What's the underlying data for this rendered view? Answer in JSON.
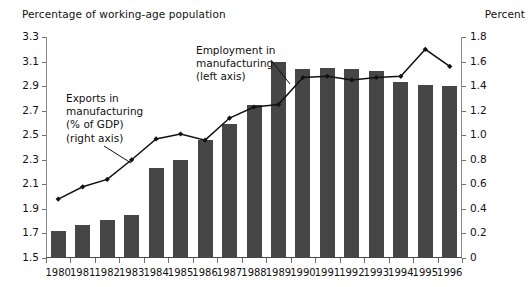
{
  "chart_data": {
    "type": "bar",
    "title": "",
    "categories": [
      "1980",
      "1981",
      "1982",
      "1983",
      "1984",
      "1985",
      "1986",
      "1987",
      "1988",
      "1989",
      "1990",
      "1991",
      "1992",
      "1993",
      "1994",
      "1995",
      "1996"
    ],
    "xlabel": "",
    "grid": false,
    "legend_position": "inline-annotations",
    "series": [
      {
        "name": "Employment in manufacturing (left axis)",
        "type": "bar",
        "axis": "left",
        "color": "#464646",
        "values": [
          1.72,
          1.77,
          1.81,
          1.85,
          2.23,
          2.3,
          2.46,
          2.59,
          2.75,
          3.1,
          3.04,
          3.05,
          3.04,
          3.02,
          2.93,
          2.91,
          2.9
        ]
      },
      {
        "name": "Exports in manufacturing (% of GDP) (right axis)",
        "type": "line",
        "axis": "right",
        "color": "#111111",
        "values": [
          0.48,
          0.58,
          0.64,
          0.8,
          0.97,
          1.01,
          0.96,
          1.14,
          1.23,
          1.25,
          1.47,
          1.48,
          1.45,
          1.47,
          1.48,
          1.7,
          1.56
        ]
      }
    ],
    "left_axis": {
      "label": "Percentage of working-age population",
      "ylim": [
        1.5,
        3.3
      ],
      "ticks": [
        1.5,
        1.7,
        1.9,
        2.1,
        2.3,
        2.5,
        2.7,
        2.9,
        3.1,
        3.3
      ],
      "tick_labels": [
        "1.5",
        "1.7",
        "1.9",
        "2.1",
        "2.3",
        "2.5",
        "2.7",
        "2.9",
        "3.1",
        "3.3"
      ]
    },
    "right_axis": {
      "label": "Percent",
      "ylim": [
        0,
        1.8
      ],
      "ticks": [
        0,
        0.2,
        0.4,
        0.6,
        0.8,
        1.0,
        1.2,
        1.4,
        1.6,
        1.8
      ],
      "tick_labels": [
        "0",
        "0.2",
        "0.4",
        "0.6",
        "0.8",
        "1.0",
        "1.2",
        "1.4",
        "1.6",
        "1.8"
      ]
    },
    "annotations": [
      {
        "name": "exports-callout",
        "lines": [
          "Exports in",
          "manufacturing",
          "(% of GDP)",
          "(right axis)"
        ]
      },
      {
        "name": "employment-callout",
        "lines": [
          "Employment in",
          "manufacturing",
          "(left axis)"
        ]
      }
    ]
  }
}
